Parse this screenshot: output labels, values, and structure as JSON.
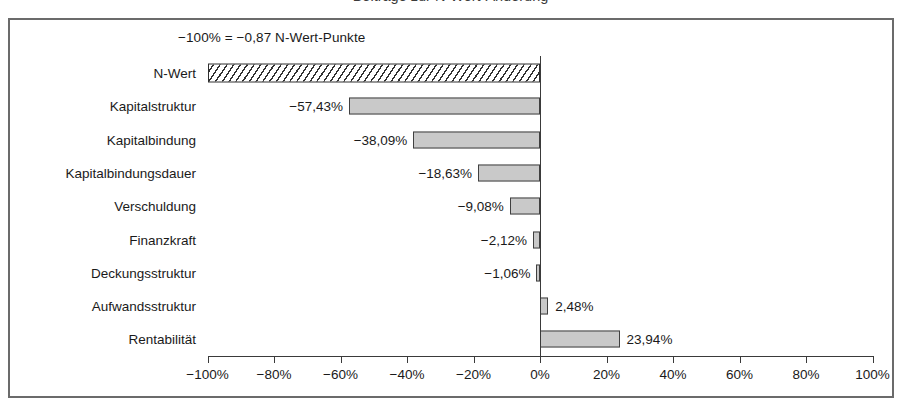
{
  "chart": {
    "title": "Beiträge zur N-Wert-Änderung",
    "annotation": "−100% = −0,87 N-Wert-Punkte",
    "xlabel": "",
    "ylabel": ""
  },
  "chart_data": {
    "type": "bar",
    "orientation": "horizontal",
    "title": "Beiträge zur N-Wert-Änderung",
    "xlabel": "",
    "ylabel": "",
    "xlim": [
      -100,
      100
    ],
    "grid": false,
    "legend": null,
    "annotations": [
      "−100% = −0,87 N-Wert-Punkte"
    ],
    "xticks": [
      -100,
      -80,
      -60,
      -40,
      -20,
      0,
      20,
      40,
      60,
      80,
      100
    ],
    "xticklabels": [
      "−100%",
      "−80%",
      "−60%",
      "−40%",
      "−20%",
      "0%",
      "20%",
      "40%",
      "60%",
      "80%",
      "100%"
    ],
    "categories": [
      "N-Wert",
      "Kapitalstruktur",
      "Kapitalbindung",
      "Kapitalbindungsdauer",
      "Verschuldung",
      "Finanzkraft",
      "Deckungsstruktur",
      "Aufwandsstruktur",
      "Rentabilität"
    ],
    "values": [
      -100,
      -57.43,
      -38.09,
      -18.63,
      -9.08,
      -2.12,
      -1.06,
      2.48,
      23.94
    ],
    "value_labels": [
      "",
      "−57,43%",
      "−38,09%",
      "−18,63%",
      "−9,08%",
      "−2,12%",
      "−1,06%",
      "2,48%",
      "23,94%"
    ],
    "bar_styles": [
      "hatched",
      "solid",
      "solid",
      "solid",
      "solid",
      "solid",
      "solid",
      "solid",
      "solid"
    ],
    "colors": {
      "bar_fill": "#c9c9c9",
      "bar_border": "#404040",
      "hatch_line": "#303030",
      "axis": "#3a3a3a",
      "frame": "#6b6b6b",
      "background": "#ffffff",
      "text": "#1a1a1a"
    }
  }
}
